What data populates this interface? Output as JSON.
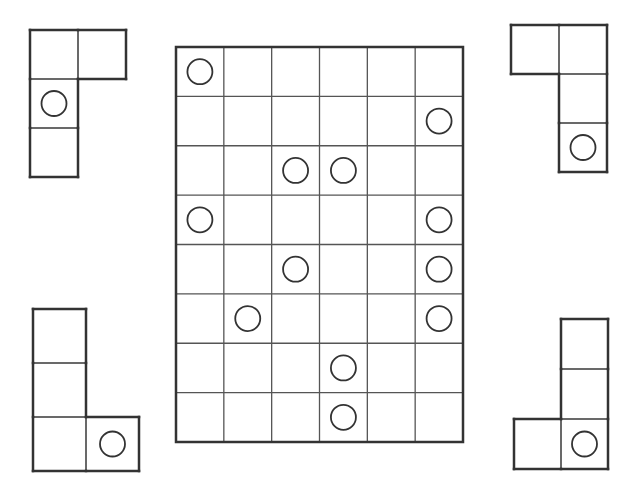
{
  "colors": {
    "background": "#ffffff",
    "line": "#333333",
    "thin_line": "#555555"
  },
  "board": {
    "x": 176,
    "y": 47,
    "width": 287,
    "height": 395,
    "cols": 6,
    "rows": 8,
    "circles": [
      [
        0,
        0
      ],
      [
        1,
        5
      ],
      [
        2,
        2
      ],
      [
        2,
        3
      ],
      [
        3,
        0
      ],
      [
        3,
        5
      ],
      [
        4,
        2
      ],
      [
        4,
        5
      ],
      [
        5,
        1
      ],
      [
        5,
        5
      ],
      [
        6,
        3
      ],
      [
        7,
        3
      ]
    ]
  },
  "pieces": [
    {
      "name": "piece-top-left",
      "x": 30,
      "y": 30,
      "cw": 48,
      "ch": 49,
      "cells": [
        [
          0,
          0
        ],
        [
          0,
          1
        ],
        [
          1,
          0
        ],
        [
          2,
          0
        ]
      ],
      "circle": [
        1,
        0
      ]
    },
    {
      "name": "piece-top-right",
      "x": 511,
      "y": 25,
      "cw": 48,
      "ch": 49,
      "cells": [
        [
          0,
          0
        ],
        [
          0,
          1
        ],
        [
          1,
          1
        ],
        [
          2,
          1
        ]
      ],
      "circle": [
        2,
        1
      ]
    },
    {
      "name": "piece-bottom-left",
      "x": 33,
      "y": 309,
      "cw": 53,
      "ch": 54,
      "cells": [
        [
          0,
          0
        ],
        [
          1,
          0
        ],
        [
          2,
          0
        ],
        [
          2,
          1
        ]
      ],
      "circle": [
        2,
        1
      ]
    },
    {
      "name": "piece-bottom-right",
      "x": 514,
      "y": 319,
      "cw": 47,
      "ch": 50,
      "cells": [
        [
          0,
          1
        ],
        [
          1,
          1
        ],
        [
          2,
          1
        ],
        [
          2,
          0
        ]
      ],
      "circle": [
        2,
        1
      ]
    }
  ]
}
